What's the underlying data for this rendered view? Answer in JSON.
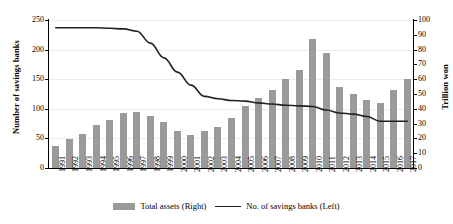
{
  "chart_data": {
    "type": "bar",
    "title": "",
    "xlabel": "",
    "categories": [
      "1991",
      "1992",
      "1993",
      "1994",
      "1995",
      "1996",
      "1997",
      "1998",
      "1999",
      "2000",
      "2001",
      "2002",
      "2003",
      "2004",
      "2005",
      "2006",
      "2007",
      "2008",
      "2009",
      "2010",
      "2011",
      "2012",
      "2013",
      "2014",
      "2015",
      "2016",
      "2017"
    ],
    "grid": true,
    "legend_position": "bottom",
    "axes": {
      "left": {
        "label": "Number of savings banks",
        "min": 0,
        "max": 250,
        "step": 50,
        "ticks": [
          "0",
          "50",
          "100",
          "150",
          "200",
          "250"
        ]
      },
      "right": {
        "label": "Trillion won",
        "min": 0,
        "max": 100,
        "step": 10,
        "ticks": [
          "0",
          "10",
          "20",
          "30",
          "40",
          "50",
          "60",
          "70",
          "80",
          "90",
          "100"
        ]
      }
    },
    "series": [
      {
        "name": "Total assets (Right)",
        "type": "bar",
        "axis": "right",
        "unit": "Trillion won",
        "color": "#9a9a9a",
        "values": [
          15,
          19.5,
          23,
          29,
          32.5,
          37,
          38,
          35,
          31,
          25,
          22,
          25,
          28,
          34,
          42,
          47,
          53,
          60,
          66,
          87,
          78,
          55,
          50,
          46,
          44,
          53,
          60
        ]
      },
      {
        "name": "No. of savings banks (Left)",
        "type": "line",
        "axis": "left",
        "unit": "banks",
        "color": "#222222",
        "values": [
          237,
          237,
          237,
          237,
          236,
          235,
          231,
          211,
          186,
          162,
          140,
          121,
          117,
          114,
          113,
          110,
          108,
          106,
          105,
          104,
          98,
          93,
          91,
          87,
          79,
          79,
          79
        ]
      }
    ],
    "legend": [
      {
        "label": "Total assets (Right)",
        "marker": "bar",
        "color": "#9a9a9a"
      },
      {
        "label": "No. of savings banks (Left)",
        "marker": "line",
        "color": "#222222"
      }
    ]
  }
}
